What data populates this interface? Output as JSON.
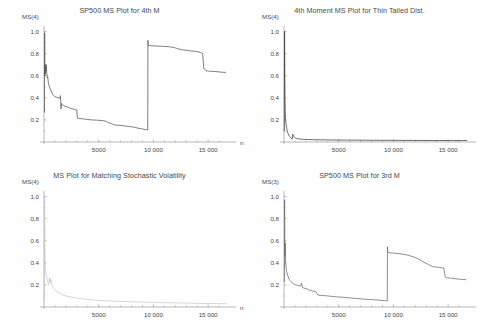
{
  "figure": {
    "name": "four-panel-ms-plot-figure",
    "background": "#fefefe",
    "axis_color": "#8a8a8a",
    "text_color": "#4a4a4a"
  },
  "chart_data": [
    {
      "id": "top-left",
      "type": "line",
      "title": "SP500 MS Plot for 4th M",
      "xlabel": "n",
      "ylabel": "MS(4)",
      "xlim": [
        0,
        17000
      ],
      "ylim": [
        0,
        1.05
      ],
      "xticks": [
        5000,
        10000,
        15000
      ],
      "xticklabels": [
        "5000",
        "10 000",
        "15 000"
      ],
      "yticks": [
        0.2,
        0.4,
        0.6,
        0.8,
        1.0
      ],
      "yticklabels": [
        "0.2",
        "0.4",
        "0.6",
        "0.8",
        "1.0"
      ],
      "grid": false,
      "legend": "none",
      "color": "#555555",
      "x": [
        40,
        60,
        75,
        90,
        110,
        130,
        150,
        175,
        200,
        230,
        260,
        300,
        340,
        380,
        430,
        500,
        560,
        620,
        700,
        800,
        900,
        1000,
        1150,
        1300,
        1450,
        1500,
        1560,
        1600,
        1650,
        1700,
        1800,
        1900,
        2000,
        2200,
        2400,
        2600,
        2800,
        3000,
        3050,
        3200,
        3500,
        3900,
        4300,
        4800,
        5200,
        5600,
        5900,
        6200,
        6400,
        6700,
        7000,
        7400,
        7800,
        8200,
        8600,
        9000,
        9300,
        9480,
        9500,
        9520,
        9700,
        10000,
        10500,
        11000,
        11500,
        11900,
        12200,
        12600,
        13000,
        13400,
        13900,
        14300,
        14500,
        14600,
        14800,
        15200,
        15700,
        16200,
        16600
      ],
      "y": [
        0.27,
        0.99,
        0.72,
        0.6,
        0.7,
        0.62,
        0.68,
        0.64,
        0.7,
        0.66,
        0.62,
        0.58,
        0.59,
        0.55,
        0.52,
        0.5,
        0.48,
        0.47,
        0.45,
        0.43,
        0.42,
        0.41,
        0.405,
        0.4,
        0.395,
        0.42,
        0.3,
        0.35,
        0.34,
        0.335,
        0.33,
        0.325,
        0.32,
        0.315,
        0.305,
        0.3,
        0.295,
        0.29,
        0.215,
        0.212,
        0.21,
        0.205,
        0.2,
        0.198,
        0.195,
        0.19,
        0.175,
        0.165,
        0.155,
        0.152,
        0.15,
        0.145,
        0.14,
        0.135,
        0.125,
        0.118,
        0.112,
        0.11,
        0.92,
        0.875,
        0.873,
        0.87,
        0.868,
        0.865,
        0.862,
        0.855,
        0.845,
        0.835,
        0.83,
        0.825,
        0.82,
        0.81,
        0.8,
        0.67,
        0.645,
        0.64,
        0.638,
        0.632,
        0.63
      ],
      "annotations": [
        "sharp drop from 1.0 near origin",
        "step jump near n=9500 from 0.11 to 0.87"
      ]
    },
    {
      "id": "top-right",
      "type": "line",
      "title": "4th Moment MS Plot for Thin Tailed Dist.",
      "xlabel": "n",
      "ylabel": "MS(4)",
      "xlim": [
        0,
        17000
      ],
      "ylim": [
        0,
        1.05
      ],
      "xticks": [
        5000,
        10000,
        15000
      ],
      "xticklabels": [
        "5000",
        "10 000",
        "15 000"
      ],
      "yticks": [
        0.2,
        0.4,
        0.6,
        0.8,
        1.0
      ],
      "yticklabels": [
        "0.2",
        "0.4",
        "0.6",
        "0.8",
        "1.0"
      ],
      "grid": false,
      "legend": "none",
      "color": "#3b3b3b",
      "x": [
        25,
        50,
        70,
        90,
        110,
        140,
        170,
        200,
        240,
        280,
        320,
        380,
        440,
        500,
        560,
        620,
        680,
        720,
        760,
        800,
        850,
        900,
        960,
        1050,
        1150,
        1300,
        1500,
        1800,
        2200,
        2700,
        3200,
        3900,
        4600,
        5400,
        6200,
        7200,
        8200,
        9400,
        10600,
        11800,
        13000,
        14200,
        15400,
        16300,
        16700
      ],
      "y": [
        0.1,
        1.0,
        0.62,
        0.4,
        0.28,
        0.21,
        0.175,
        0.15,
        0.125,
        0.105,
        0.09,
        0.075,
        0.062,
        0.052,
        0.045,
        0.038,
        0.032,
        0.028,
        0.026,
        0.07,
        0.058,
        0.048,
        0.042,
        0.036,
        0.032,
        0.029,
        0.026,
        0.024,
        0.022,
        0.021,
        0.02,
        0.019,
        0.018,
        0.0175,
        0.017,
        0.016,
        0.0155,
        0.015,
        0.0145,
        0.014,
        0.0138,
        0.0135,
        0.0132,
        0.013,
        0.013
      ],
      "annotations": [
        "spike to 1.0 at small n then rapid decay to near zero",
        "small secondary bump near n=800"
      ]
    },
    {
      "id": "bottom-left",
      "type": "line",
      "title": "MS Plot for Matching Stochastic Volatility",
      "xlabel": "n",
      "ylabel": "MS(4)",
      "xlim": [
        0,
        17000
      ],
      "ylim": [
        0,
        1.05
      ],
      "xticks": [
        5000,
        10000,
        15000
      ],
      "xticklabels": [
        "5000",
        "10 000",
        "15 000"
      ],
      "yticks": [
        0.2,
        0.4,
        0.6,
        0.8,
        1.0
      ],
      "yticklabels": [
        "0.2",
        "0.4",
        "0.6",
        "0.8",
        "1.0"
      ],
      "grid": false,
      "legend": "none",
      "color": "#c8c8c8",
      "x": [
        30,
        55,
        80,
        110,
        140,
        180,
        220,
        270,
        320,
        380,
        440,
        500,
        560,
        620,
        690,
        760,
        830,
        900,
        980,
        1100,
        1250,
        1400,
        1600,
        1900,
        2200,
        2600,
        3000,
        3400,
        3800,
        4300,
        4800,
        5400,
        6000,
        6700,
        7400,
        8200,
        9000,
        9900,
        10800,
        11700,
        12600,
        13600,
        14600,
        15600,
        16400,
        16700
      ],
      "y": [
        0.06,
        1.0,
        0.52,
        0.4,
        0.35,
        0.305,
        0.28,
        0.255,
        0.235,
        0.215,
        0.2,
        0.265,
        0.22,
        0.255,
        0.21,
        0.19,
        0.175,
        0.165,
        0.155,
        0.145,
        0.135,
        0.125,
        0.115,
        0.105,
        0.095,
        0.088,
        0.082,
        0.075,
        0.07,
        0.066,
        0.062,
        0.058,
        0.055,
        0.052,
        0.049,
        0.046,
        0.044,
        0.042,
        0.04,
        0.038,
        0.036,
        0.034,
        0.032,
        0.031,
        0.03,
        0.03
      ],
      "annotations": [
        "very light grey curve",
        "spike to 1.0 then monotone decay with small oscillation near n=600"
      ]
    },
    {
      "id": "bottom-right",
      "type": "line",
      "title": "SP500 MS Plot for 3rd M",
      "xlabel": "n",
      "ylabel": "MS(3)",
      "xlim": [
        0,
        17000
      ],
      "ylim": [
        0,
        1.05
      ],
      "xticks": [
        5000,
        10000,
        15000
      ],
      "xticklabels": [
        "5000",
        "10 000",
        "15 000"
      ],
      "yticks": [
        0.2,
        0.4,
        0.6,
        0.8,
        1.0
      ],
      "yticklabels": [
        "0.2",
        "0.4",
        "0.6",
        "0.8",
        "1.0"
      ],
      "grid": false,
      "legend": "none",
      "color": "#6a6a6a",
      "x": [
        35,
        55,
        75,
        95,
        120,
        150,
        190,
        240,
        300,
        380,
        460,
        560,
        680,
        800,
        950,
        1100,
        1300,
        1500,
        1600,
        1700,
        1800,
        1900,
        2050,
        2300,
        2600,
        2900,
        3100,
        3300,
        3700,
        4200,
        4800,
        5400,
        6000,
        6600,
        7200,
        7900,
        8600,
        9200,
        9440,
        9460,
        9480,
        9700,
        10100,
        10600,
        11200,
        11800,
        12300,
        12800,
        13200,
        13600,
        13900,
        14200,
        14600,
        14750,
        14850,
        15200,
        15700,
        16200,
        16600
      ],
      "y": [
        0.23,
        0.97,
        0.5,
        0.46,
        0.58,
        0.4,
        0.36,
        0.32,
        0.3,
        0.275,
        0.255,
        0.24,
        0.225,
        0.215,
        0.205,
        0.2,
        0.195,
        0.19,
        0.215,
        0.175,
        0.172,
        0.17,
        0.165,
        0.155,
        0.145,
        0.14,
        0.108,
        0.106,
        0.103,
        0.098,
        0.092,
        0.088,
        0.082,
        0.078,
        0.072,
        0.068,
        0.062,
        0.058,
        0.055,
        0.545,
        0.495,
        0.49,
        0.487,
        0.482,
        0.472,
        0.455,
        0.435,
        0.405,
        0.385,
        0.365,
        0.362,
        0.358,
        0.352,
        0.27,
        0.265,
        0.262,
        0.255,
        0.25,
        0.248
      ],
      "annotations": [
        "step jump near n=9450 from 0.055 to 0.50",
        "terminal level about 0.25"
      ]
    }
  ]
}
